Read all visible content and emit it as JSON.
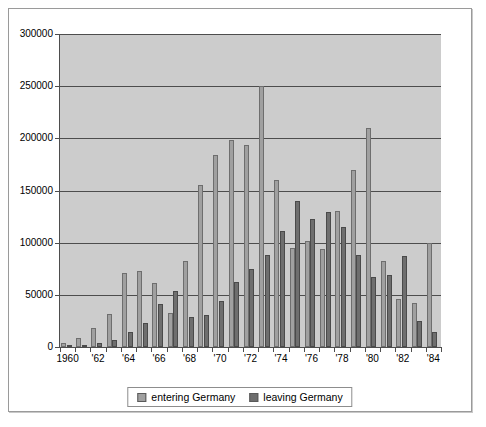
{
  "chart_data": {
    "type": "bar",
    "title": "",
    "xlabel": "",
    "ylabel": "",
    "ylim": [
      0,
      300000
    ],
    "ytick_step": 50000,
    "yticks": [
      "0",
      "50000",
      "100000",
      "150000",
      "200000",
      "250000",
      "300000"
    ],
    "grid": true,
    "legend_position": "bottom-center",
    "categories": [
      "1960",
      "1961",
      "1962",
      "1963",
      "1964",
      "1965",
      "1966",
      "1967",
      "1968",
      "1969",
      "1970",
      "1971",
      "1972",
      "1973",
      "1974",
      "1975",
      "1976",
      "1977",
      "1978",
      "1979",
      "1980",
      "1981",
      "1982",
      "1983",
      "1984"
    ],
    "xtick_labels": [
      "1960",
      "",
      "'62",
      "",
      "'64",
      "",
      "'66",
      "",
      "'68",
      "",
      "'70",
      "",
      "'72",
      "",
      "'74",
      "",
      "'76",
      "",
      "'78",
      "",
      "'80",
      "",
      "'82",
      "",
      "'84"
    ],
    "series": [
      {
        "name": "entering Germany",
        "color": "#a0a0a0",
        "values": [
          4000,
          9000,
          18000,
          32000,
          71000,
          73000,
          61000,
          33000,
          82000,
          155000,
          184000,
          198000,
          194000,
          250000,
          160000,
          95000,
          102000,
          94000,
          130000,
          170000,
          210000,
          82000,
          46000,
          42000,
          100000
        ]
      },
      {
        "name": "leaving Germany",
        "color": "#6e6e6e",
        "values": [
          1500,
          2000,
          4000,
          7000,
          14000,
          23000,
          41000,
          54000,
          29000,
          31000,
          44000,
          62000,
          75000,
          88000,
          111000,
          140000,
          123000,
          129000,
          115000,
          88000,
          67000,
          69000,
          87000,
          25000,
          14000
        ]
      }
    ]
  },
  "legend": {
    "entries": [
      {
        "label": "entering Germany"
      },
      {
        "label": "leaving Germany"
      }
    ]
  }
}
